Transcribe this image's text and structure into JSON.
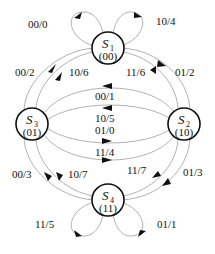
{
  "states": [
    {
      "id": "S1",
      "name": "S",
      "sub": "1",
      "code": "(00)"
    },
    {
      "id": "S2",
      "name": "S",
      "sub": "2",
      "code": "(10)"
    },
    {
      "id": "S3",
      "name": "S",
      "sub": "3",
      "code": "(01)"
    },
    {
      "id": "S4",
      "name": "S",
      "sub": "4",
      "code": "(11)"
    }
  ],
  "transitions": [
    {
      "from": "S1",
      "to": "S1",
      "label": "00/0"
    },
    {
      "from": "S1",
      "to": "S1",
      "label": "10/4"
    },
    {
      "from": "S3",
      "to": "S1",
      "label": "00/2"
    },
    {
      "from": "S3",
      "to": "S1",
      "label": "10/6"
    },
    {
      "from": "S2",
      "to": "S1",
      "label": "11/6"
    },
    {
      "from": "S1",
      "to": "S2",
      "label": "01/2"
    },
    {
      "from": "S2",
      "to": "S3",
      "label": "00/1"
    },
    {
      "from": "S2",
      "to": "S3",
      "label": "10/5"
    },
    {
      "from": "S3",
      "to": "S2",
      "label": "01/0"
    },
    {
      "from": "S3",
      "to": "S2",
      "label": "11/4"
    },
    {
      "from": "S4",
      "to": "S3",
      "label": "00/3"
    },
    {
      "from": "S4",
      "to": "S3",
      "label": "10/7"
    },
    {
      "from": "S2",
      "to": "S4",
      "label": "11/7"
    },
    {
      "from": "S2",
      "to": "S4",
      "label": "01/3"
    },
    {
      "from": "S4",
      "to": "S4",
      "label": "11/5"
    },
    {
      "from": "S4",
      "to": "S4",
      "label": "01/1"
    }
  ]
}
